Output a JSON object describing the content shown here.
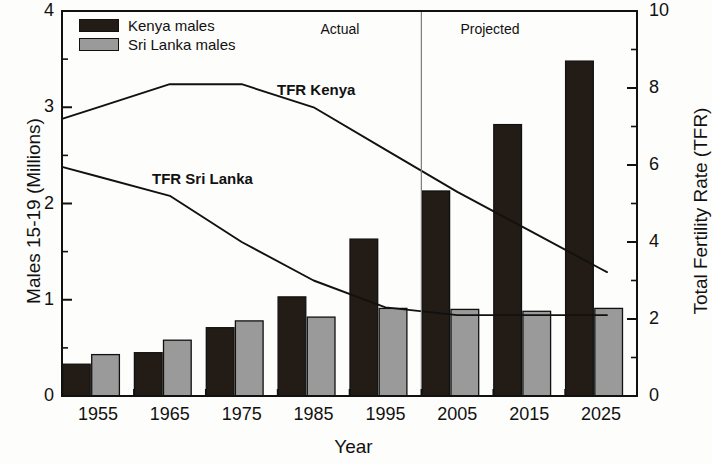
{
  "chart_data": {
    "type": "bar",
    "title": "",
    "xlabel": "Year",
    "ylabel": "Males 15-19 (Millions)",
    "ylabel_right": "Total Fertility Rate (TFR)",
    "categories": [
      "1955",
      "1965",
      "1975",
      "1985",
      "1995",
      "2005",
      "2015",
      "2025"
    ],
    "ylim": [
      0,
      4
    ],
    "yticks": [
      "0",
      "1",
      "2",
      "3",
      "4"
    ],
    "ylim_right": [
      0,
      10
    ],
    "yticks_right": [
      "0",
      "2",
      "4",
      "6",
      "8",
      "10"
    ],
    "grid": false,
    "legend_position": "top-left",
    "series": [
      {
        "name": "Kenya males",
        "type": "bar",
        "axis": "left",
        "color": "#231c16",
        "values": [
          0.33,
          0.45,
          0.71,
          1.03,
          1.63,
          2.13,
          2.82,
          3.48
        ]
      },
      {
        "name": "Sri Lanka males",
        "type": "bar",
        "axis": "left",
        "color": "#9a9a9a",
        "values": [
          0.43,
          0.58,
          0.78,
          0.82,
          0.91,
          0.9,
          0.88,
          0.91
        ]
      },
      {
        "name": "TFR Kenya",
        "type": "line",
        "axis": "right",
        "color": "#111111",
        "values": [
          7.5,
          8.1,
          8.1,
          7.5,
          6.4,
          5.3,
          4.3,
          3.3
        ]
      },
      {
        "name": "TFR Sri Lanka",
        "type": "line",
        "axis": "right",
        "color": "#111111",
        "values": [
          5.7,
          5.2,
          4.0,
          3.0,
          2.3,
          2.1,
          2.1,
          2.1
        ]
      }
    ],
    "annotations": [
      {
        "text": "Actual",
        "x": "1985",
        "note": "period label left of divider"
      },
      {
        "text": "Projected",
        "x": "2010",
        "note": "period label right of divider"
      },
      {
        "text": "TFR Kenya",
        "note": "inline series label on Kenya TFR line"
      },
      {
        "text": "TFR Sri Lanka",
        "note": "inline series label on Sri Lanka TFR line"
      }
    ],
    "divider": {
      "label": "actual-projected-divider",
      "between": [
        "1995",
        "2005"
      ]
    }
  },
  "legend": {
    "items": [
      {
        "label": "Kenya males",
        "color": "#231c16"
      },
      {
        "label": "Sri Lanka males",
        "color": "#9a9a9a"
      }
    ]
  },
  "labels": {
    "actual": "Actual",
    "projected": "Projected",
    "tfr_kenya": "TFR Kenya",
    "tfr_sri_lanka": "TFR Sri Lanka"
  }
}
